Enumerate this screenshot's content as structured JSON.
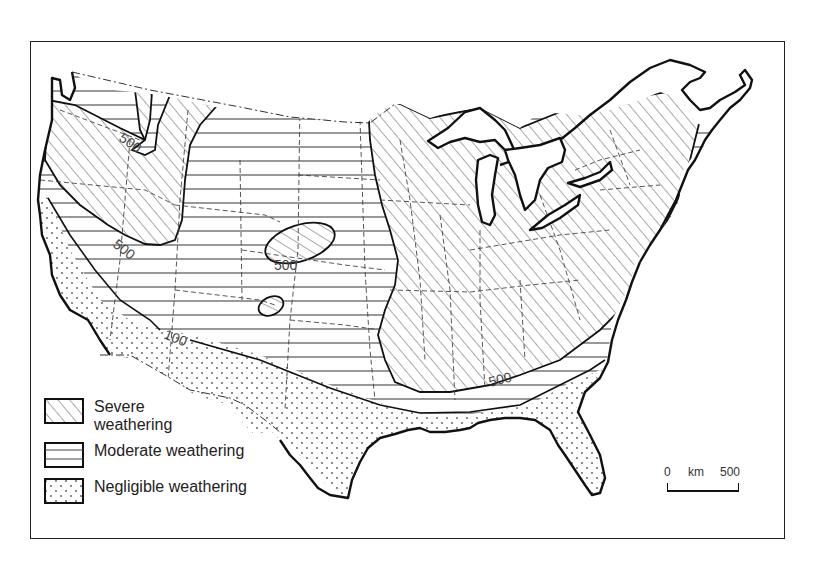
{
  "map": {
    "subject": "Weathering severity zones, contiguous United States",
    "zones": [
      {
        "id": "severe",
        "label": "Severe weathering",
        "pattern": "diagonal-hatch"
      },
      {
        "id": "moderate",
        "label": "Moderate weathering",
        "pattern": "horizontal-lines"
      },
      {
        "id": "negligible",
        "label": "Negligible weathering",
        "pattern": "dots"
      }
    ],
    "contour_labels": [
      {
        "value": "500",
        "location": "northwest interior"
      },
      {
        "value": "500",
        "location": "west coast range"
      },
      {
        "value": "500",
        "location": "central isolated area"
      },
      {
        "value": "100",
        "location": "southwest boundary"
      },
      {
        "value": "500",
        "location": "southeast boundary"
      }
    ],
    "colors": {
      "ink": "#111111",
      "background": "#ffffff",
      "hatch": "#555555"
    }
  },
  "legend": {
    "severe_label": "Severe weathering",
    "moderate_label": "Moderate weathering",
    "negligible_label": "Negligible weathering"
  },
  "scale_bar": {
    "zero": "0",
    "unit": "km",
    "max": "500"
  },
  "contours": {
    "nw": "500",
    "west": "500",
    "central": "500",
    "sw": "100",
    "se": "500"
  }
}
